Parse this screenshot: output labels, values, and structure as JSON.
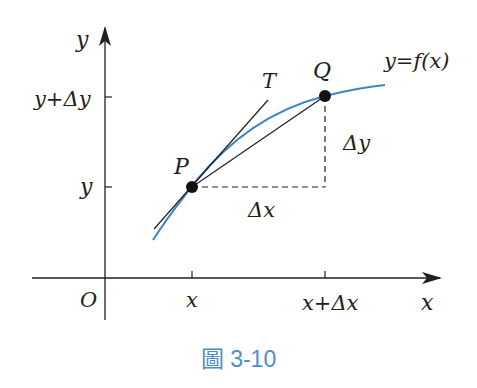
{
  "figure": {
    "caption": "圖 3-10",
    "colors": {
      "curve": "#3d86c6",
      "lines": "#231f20",
      "caption": "#4a8fcc"
    },
    "axes": {
      "x_label": "x",
      "y_label": "y",
      "origin_label": "O"
    },
    "ticks": {
      "x": [
        "x",
        "x+Δx"
      ],
      "y": [
        "y",
        "y+Δy"
      ]
    },
    "points": {
      "P": "P",
      "Q": "Q"
    },
    "tangent_label": "T",
    "function_label": "y=f(x)",
    "increments": {
      "dx": "Δx",
      "dy": "Δy"
    }
  }
}
